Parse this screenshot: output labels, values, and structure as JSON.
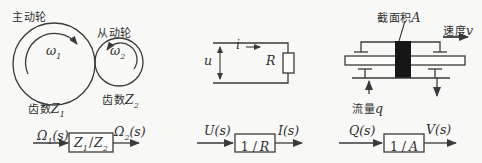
{
  "colors": {
    "paper": "#f8f8f6",
    "ink": "#3a3a3a",
    "label": "#2f2f2f",
    "piston": "#161616",
    "box_fill": "#fcfcfa"
  },
  "gear_system": {
    "driving_wheel_label": "主动轮",
    "driven_wheel_label": "从动轮",
    "omega1": {
      "base": "ω",
      "sub": "1"
    },
    "omega2": {
      "base": "ω",
      "sub": "2"
    },
    "teeth1": {
      "prefix": "齿数",
      "symbol": "Z",
      "sub": "1"
    },
    "teeth2": {
      "prefix": "齿数",
      "symbol": "Z",
      "sub": "2"
    },
    "block": {
      "input": {
        "base": "Ω",
        "sub": "1",
        "suffix": "(s)"
      },
      "transfer": {
        "num": "Z",
        "num_sub": "1",
        "slash": "/",
        "den": "Z",
        "den_sub": "2"
      },
      "output": {
        "base": "Ω",
        "sub": "2",
        "suffix": "(s)"
      }
    }
  },
  "circuit_system": {
    "current_symbol": "i",
    "voltage_symbol": "u",
    "resistor_symbol": "R",
    "block": {
      "input": "U(s)",
      "transfer_prefix": "1 /",
      "transfer_symbol": "R",
      "output": "I(s)"
    }
  },
  "hydraulic_system": {
    "area_label": {
      "prefix": "截面积",
      "symbol": "A"
    },
    "speed_label": {
      "prefix": "速度",
      "symbol": "v"
    },
    "flow_label": {
      "prefix": "流量",
      "symbol": "q"
    },
    "block": {
      "input": "Q(s)",
      "transfer_prefix": "1 /",
      "transfer_symbol": "A",
      "output": "V(s)"
    }
  }
}
